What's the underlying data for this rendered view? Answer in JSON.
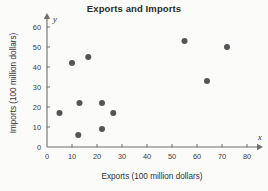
{
  "chart_data": {
    "type": "scatter",
    "title": "Exports and Imports",
    "xlabel": "Exports (100 million dollars)",
    "ylabel": "Imports (100 million dollars)",
    "x_axis_symbol": "x",
    "y_axis_symbol": "y",
    "xlim": [
      0,
      84
    ],
    "ylim": [
      0,
      64
    ],
    "xticks": [
      0,
      10,
      20,
      30,
      40,
      50,
      60,
      70,
      80
    ],
    "yticks": [
      0,
      10,
      20,
      30,
      40,
      50,
      60
    ],
    "grid": false,
    "legend": null,
    "marker_color": "#555558",
    "axis_color": "#6f6f6f",
    "background_color": "#fbfbf9",
    "points": [
      {
        "x": 5,
        "y": 17
      },
      {
        "x": 10,
        "y": 42
      },
      {
        "x": 12.5,
        "y": 6
      },
      {
        "x": 13,
        "y": 22
      },
      {
        "x": 16.5,
        "y": 45
      },
      {
        "x": 22,
        "y": 9
      },
      {
        "x": 22,
        "y": 22
      },
      {
        "x": 26.5,
        "y": 17
      },
      {
        "x": 55,
        "y": 53
      },
      {
        "x": 64,
        "y": 33
      },
      {
        "x": 72,
        "y": 50
      }
    ]
  }
}
